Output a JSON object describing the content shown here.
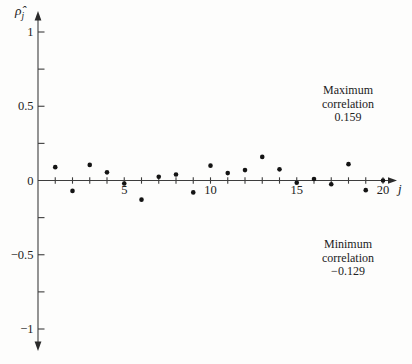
{
  "figure": {
    "ylabel": {
      "main": "ρ̂",
      "sub": "j"
    },
    "xlabel": "j",
    "annotations": {
      "max": {
        "line1": "Maximum",
        "line2": "correlation",
        "value": "0.159"
      },
      "min": {
        "line1": "Minimum",
        "line2": "correlation",
        "value": "−0.129"
      }
    }
  },
  "chart_data": {
    "type": "scatter",
    "title": "",
    "xlabel": "j",
    "ylabel": "ρ̂_j (sample autocorrelation)",
    "x": [
      1,
      2,
      3,
      4,
      5,
      6,
      7,
      8,
      9,
      10,
      11,
      12,
      13,
      14,
      15,
      16,
      17,
      18,
      19,
      20
    ],
    "y": [
      0.09,
      -0.07,
      0.105,
      0.055,
      -0.02,
      -0.129,
      0.025,
      0.04,
      -0.08,
      0.1,
      0.05,
      0.07,
      0.159,
      0.075,
      -0.015,
      0.01,
      -0.025,
      0.11,
      -0.065,
      0.0
    ],
    "xlim": [
      0,
      20.8
    ],
    "ylim": [
      -1.15,
      1.15
    ],
    "grid": false,
    "legend_position": "none",
    "max_correlation": 0.159,
    "min_correlation": -0.129,
    "x_ticks": [
      1,
      2,
      3,
      4,
      5,
      6,
      7,
      8,
      9,
      10,
      11,
      12,
      13,
      14,
      15,
      16,
      17,
      18,
      19,
      20
    ],
    "x_tick_labels": [
      {
        "value": 5,
        "label": "5"
      },
      {
        "value": 10,
        "label": "10"
      },
      {
        "value": 15,
        "label": "15"
      },
      {
        "value": 20,
        "label": "20"
      }
    ],
    "y_ticks": [
      1,
      0.75,
      0.5,
      0.25,
      -0.25,
      -0.5,
      -0.75,
      -1
    ],
    "y_tick_labels": [
      {
        "value": 1,
        "label": "1"
      },
      {
        "value": 0.5,
        "label": "0.5"
      },
      {
        "value": 0,
        "label": "0"
      },
      {
        "value": -0.5,
        "label": "−0.5"
      },
      {
        "value": -1,
        "label": "−1"
      }
    ],
    "point_color": "#141414",
    "axis_color": "#3d3d3d"
  }
}
